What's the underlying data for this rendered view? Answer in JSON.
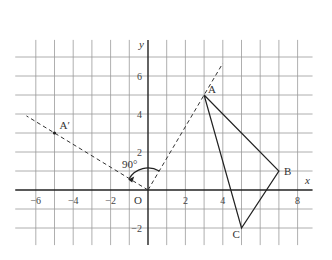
{
  "diagram": {
    "axes": {
      "x_label": "x",
      "y_label": "y",
      "origin_label": "O",
      "x_range": [
        -7,
        9
      ],
      "y_range": [
        -3,
        8
      ],
      "x_ticks": [
        {
          "value": -6,
          "label": "−6"
        },
        {
          "value": -4,
          "label": "−4"
        },
        {
          "value": -2,
          "label": "−2"
        },
        {
          "value": 2,
          "label": "2"
        },
        {
          "value": 4,
          "label": "4"
        },
        {
          "value": 8,
          "label": "8"
        }
      ],
      "y_ticks": [
        {
          "value": 6,
          "label": "6"
        },
        {
          "value": 4,
          "label": "4"
        },
        {
          "value": 2,
          "label": "2"
        },
        {
          "value": -2,
          "label": "−2"
        }
      ]
    },
    "triangle": {
      "points": [
        {
          "name": "A",
          "x": 3,
          "y": 5
        },
        {
          "name": "B",
          "x": 7,
          "y": 1
        },
        {
          "name": "C",
          "x": 5,
          "y": -2
        }
      ]
    },
    "image_point": {
      "name": "A′",
      "x": -5,
      "y": 3
    },
    "rays": [
      {
        "name": "ray-OA",
        "from": [
          0,
          0
        ],
        "to": [
          4,
          6.67
        ]
      },
      {
        "name": "ray-OA-prime",
        "from": [
          0,
          0
        ],
        "to": [
          -6.5,
          3.9
        ]
      }
    ],
    "angle_label": "90°"
  }
}
